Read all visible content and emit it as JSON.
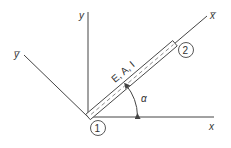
{
  "diagram": {
    "axes": {
      "x_label": "x",
      "y_label": "y",
      "x_local_label": "x̅",
      "y_local_label": "y̅"
    },
    "element": {
      "properties_label": "E, A, I"
    },
    "nodes": [
      {
        "id": "1",
        "label": "1"
      },
      {
        "id": "2",
        "label": "2"
      }
    ],
    "angle": {
      "label": "α"
    },
    "colors": {
      "line": "#444444",
      "background": "#ffffff"
    }
  }
}
